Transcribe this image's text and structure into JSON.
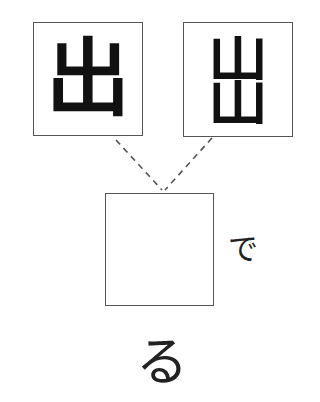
{
  "puzzle": {
    "type": "kanji-combination",
    "source_boxes": [
      {
        "id": "left",
        "character": "出",
        "style": "standard"
      },
      {
        "id": "right",
        "character": "出",
        "style": "stacked-mountains",
        "parts": [
          "山",
          "山"
        ]
      }
    ],
    "answer_box": {
      "value": "",
      "placeholder": ""
    },
    "suffix_right": "で",
    "suffix_below": "る",
    "colors": {
      "border": "#555555",
      "ink": "#111111",
      "dash": "#555555",
      "background": "#ffffff"
    }
  }
}
